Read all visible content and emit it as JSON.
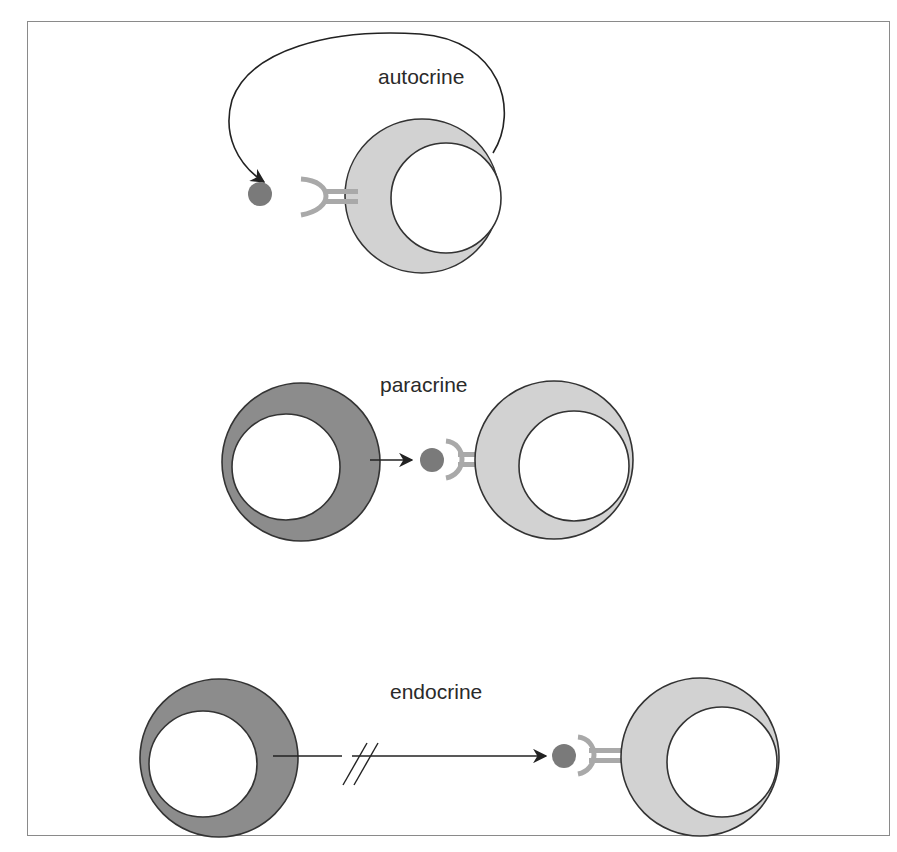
{
  "figure": {
    "title": "",
    "panels": [
      {
        "id": "autocrine",
        "label": "autocrine",
        "description": "Signaling cell releases a ligand that loops back to bind a receptor on the same cell"
      },
      {
        "id": "paracrine",
        "label": "paracrine",
        "description": "Signaling cell releases a ligand that binds a receptor on an adjacent target cell"
      },
      {
        "id": "endocrine",
        "label": "endocrine",
        "description": "Signaling cell releases a ligand that travels a long distance (broken line) to a distant target cell"
      }
    ]
  },
  "colors": {
    "secreting_cell": "#8c8c8c",
    "target_cell": "#d2d2d2",
    "ligand": "#7a7a7a",
    "receptor": "#a9a9a9",
    "outline": "#333333",
    "frame": "#8a8a8a"
  },
  "icons": {
    "ligand": "ligand-dot-icon",
    "receptor": "receptor-y-icon",
    "arrow": "arrow-right-icon",
    "break": "double-slash-break-icon"
  }
}
